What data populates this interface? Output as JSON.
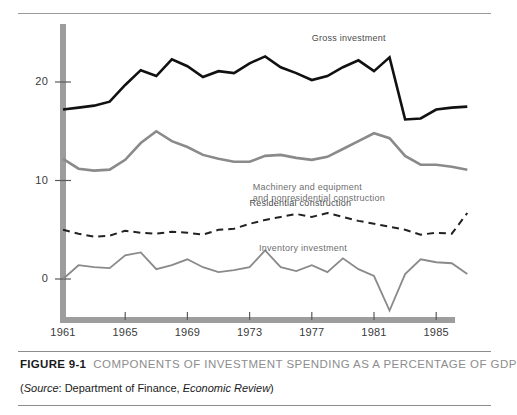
{
  "caption": {
    "figure_number": "FIGURE 9-1",
    "title": "COMPONENTS OF INVESTMENT SPENDING AS A PERCENTAGE OF GDP",
    "source_prefix": "(",
    "source_label": "Source",
    "source_sep": ": Department of Finance, ",
    "source_publication": "Economic Review",
    "source_suffix": ")"
  },
  "chart_data": {
    "type": "line",
    "title": "COMPONENTS OF INVESTMENT SPENDING AS A PERCENTAGE OF GDP",
    "subtitle": "",
    "xlabel": "",
    "ylabel": "",
    "xlim": [
      1961,
      1987
    ],
    "ylim": [
      -5,
      25
    ],
    "yticks": [
      0,
      10,
      20
    ],
    "ytick_labels": [
      "0",
      "10",
      "20"
    ],
    "xticks": [
      1961,
      1965,
      1969,
      1973,
      1977,
      1981,
      1985
    ],
    "xtick_labels": [
      "1961",
      "1965",
      "1969",
      "1973",
      "1977",
      "1981",
      "1985"
    ],
    "grid": false,
    "legend_position": "inline-annotations",
    "x": [
      1961,
      1962,
      1963,
      1964,
      1965,
      1966,
      1967,
      1968,
      1969,
      1970,
      1971,
      1972,
      1973,
      1974,
      1975,
      1976,
      1977,
      1978,
      1979,
      1980,
      1981,
      1982,
      1983,
      1984,
      1985,
      1986,
      1987
    ],
    "series": [
      {
        "name": "Gross investment",
        "color": "#111111",
        "style": "solid",
        "width": 2.6,
        "label_x": 1977.0,
        "label_y": 24.4,
        "values": [
          17.2,
          17.4,
          17.6,
          18.0,
          19.7,
          21.2,
          20.6,
          22.3,
          21.6,
          20.5,
          21.1,
          20.9,
          21.9,
          22.6,
          21.5,
          20.9,
          20.2,
          20.6,
          21.5,
          22.2,
          21.1,
          22.5,
          16.2,
          16.3,
          17.2,
          17.4,
          17.5
        ],
        "approx_values": [
          17.2,
          17.4,
          17.6,
          18.0,
          19.7,
          21.2,
          20.6,
          22.3,
          21.6,
          20.5,
          21.1,
          20.9,
          21.9,
          22.6,
          21.5,
          20.9,
          20.2,
          20.6,
          21.5,
          22.2,
          21.1,
          22.5,
          16.2,
          16.3,
          17.2,
          17.4,
          18.3
        ]
      },
      {
        "name": "Machinery and equipment and nonresidential construction",
        "label_line1": "Machinery and equipment",
        "label_line2": "and nonresidential construction",
        "color": "#8a8a8a",
        "style": "solid",
        "width": 2.6,
        "label_x": 1973.2,
        "label_y": 9.2,
        "values": [
          12.2,
          11.2,
          11.0,
          11.1,
          12.1,
          13.8,
          15.0,
          14.0,
          13.4,
          12.6,
          12.2,
          11.9,
          11.9,
          12.5,
          12.6,
          12.3,
          12.1,
          12.4,
          13.2,
          14.0,
          14.8,
          14.3,
          12.5,
          11.6,
          11.6,
          11.4,
          11.1
        ],
        "approx_values": [
          12.2,
          11.2,
          11.0,
          11.1,
          12.1,
          13.8,
          15.0,
          14.0,
          13.4,
          12.6,
          12.2,
          11.9,
          11.9,
          12.5,
          12.6,
          12.3,
          12.1,
          12.4,
          13.2,
          14.0,
          14.8,
          14.3,
          12.5,
          11.6,
          11.6,
          11.4,
          11.1
        ]
      },
      {
        "name": "Residential construction",
        "color": "#222222",
        "style": "dashed",
        "width": 2.0,
        "label_x": 1973.0,
        "label_y": 7.6,
        "values": [
          5.0,
          4.6,
          4.3,
          4.4,
          4.9,
          4.7,
          4.6,
          4.8,
          4.7,
          4.5,
          5.0,
          5.1,
          5.6,
          6.0,
          6.3,
          6.6,
          6.3,
          6.7,
          6.3,
          5.9,
          5.6,
          5.3,
          5.0,
          4.5,
          4.7,
          4.6,
          6.7
        ],
        "approx_values": [
          5.0,
          4.6,
          4.3,
          4.4,
          4.9,
          4.7,
          4.6,
          4.8,
          4.7,
          4.5,
          5.0,
          5.1,
          5.6,
          6.0,
          6.3,
          6.6,
          6.3,
          6.7,
          6.3,
          5.9,
          5.6,
          5.3,
          5.0,
          4.5,
          4.7,
          4.6,
          6.7
        ]
      },
      {
        "name": "Inventory investment",
        "color": "#8a8a8a",
        "style": "solid",
        "width": 1.8,
        "label_x": 1973.6,
        "label_y": 3.0,
        "values": [
          0.0,
          1.4,
          1.2,
          1.1,
          2.4,
          2.7,
          1.0,
          1.4,
          2.0,
          1.2,
          0.7,
          0.9,
          1.2,
          2.9,
          1.2,
          0.8,
          1.4,
          0.7,
          2.1,
          1.0,
          0.3,
          -3.2,
          0.5,
          2.0,
          1.7,
          1.6,
          0.5
        ],
        "approx_values": [
          0.0,
          1.4,
          1.2,
          1.1,
          2.4,
          2.7,
          1.0,
          1.4,
          2.0,
          1.2,
          0.7,
          0.9,
          1.2,
          2.9,
          1.2,
          0.8,
          1.4,
          0.7,
          2.1,
          1.0,
          0.3,
          -3.2,
          0.5,
          2.0,
          1.7,
          1.6,
          0.5
        ]
      }
    ]
  }
}
